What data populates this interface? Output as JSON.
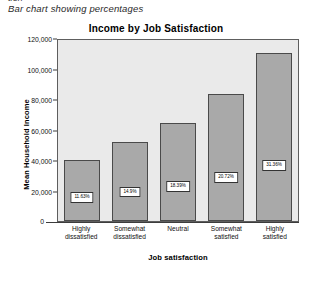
{
  "caption": {
    "clipped_top_text": "tion",
    "text": "Bar chart showing percentages"
  },
  "chart_data": {
    "type": "bar",
    "title": "Income by Job Satisfaction",
    "xlabel": "Job satisfaction",
    "ylabel": "Mean Household Income",
    "ylim": [
      0,
      120000
    ],
    "ytick_labels": [
      "0",
      "20,000",
      "40,000",
      "60,000",
      "80,000",
      "100,000",
      "120,000"
    ],
    "ytick_values": [
      0,
      20000,
      40000,
      60000,
      80000,
      100000,
      120000
    ],
    "grid": false,
    "legend": "none",
    "categories": [
      "Highly dissatisfied",
      "Somewhat dissatisfied",
      "Neutral",
      "Somewhat satisfied",
      "Highly satisfied"
    ],
    "category_lines": [
      [
        "Highly",
        "dissatisfied"
      ],
      [
        "Somewhat",
        "dissatisfied"
      ],
      [
        "Neutral",
        ""
      ],
      [
        "Somewhat",
        "satisfied"
      ],
      [
        "Highly",
        "satisfied"
      ]
    ],
    "values": [
      40000,
      52000,
      64000,
      83000,
      110000
    ],
    "data_labels": [
      "11.63%",
      "14.9%",
      "18.39%",
      "20.72%",
      "31.36%"
    ],
    "colors": {
      "bar_fill": "#a9a9a9",
      "bar_border": "#4a4a4a",
      "plot_background": "#eaeaea",
      "plot_border": "#5e5e5e",
      "label_background": "#ffffff",
      "label_border": "#333333",
      "text": "#111111"
    }
  }
}
